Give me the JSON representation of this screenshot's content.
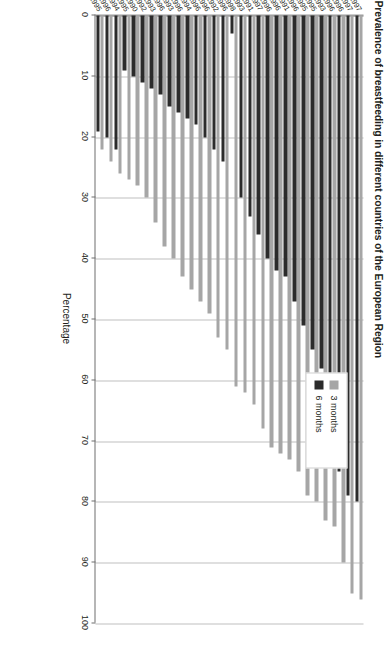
{
  "chart_data": {
    "type": "bar",
    "orientation": "horizontal",
    "title": "Prevalence of breastfeeding in different countries of the European Region",
    "xlabel": "",
    "ylabel": "Percentage",
    "ylim": [
      0,
      100
    ],
    "ytick_step": 10,
    "yticks": [
      "0",
      "10",
      "20",
      "30",
      "40",
      "50",
      "60",
      "70",
      "80",
      "90",
      "100"
    ],
    "grid": true,
    "legend_position": "upper-right",
    "legend": [
      "3 months",
      "6 months"
    ],
    "categories": [
      "Uzbekistan 1997",
      "Kyrgyzstan 1997",
      "Azerbaijan 1996",
      "Sweden 1996",
      "Bosnia and Herzegovina 1993",
      "Kazakhstan 1995",
      "Tajikistan 1995",
      "Federal Republic of Yugoslavia 1996",
      "Norway 1991",
      "Bulgaria 1989-1996",
      "Republic of Moldova 1996",
      "Poland 1997",
      "Czech Republic 1991",
      "Armenia 1993",
      "Georgia 1998",
      "Germany 1996",
      "Denmark 1992",
      "Estonia 1996",
      "Ukraine 1996",
      "Switzerland 1994",
      "Netherlands 1996",
      "Belarus 1993",
      "Russian Federation 1996",
      "Lithuania 1993",
      "Ireland 1992",
      "Slovakia 1990",
      "Croatia 1995",
      "Luxembourg 1994",
      "Latvia 1996",
      "United Kingdom 1995"
    ],
    "series": [
      {
        "name": "3 months",
        "color": "#a6a6a6",
        "values": [
          96,
          95,
          90,
          84,
          83,
          80,
          79,
          75,
          73,
          72,
          71,
          68,
          64,
          62,
          61,
          55,
          53,
          49,
          47,
          45,
          43,
          40,
          38,
          34,
          30,
          28,
          27,
          26,
          24,
          22
        ]
      },
      {
        "name": "6 months",
        "color": "#2b2b2b",
        "values": [
          80,
          79,
          75,
          63,
          58,
          55,
          51,
          47,
          43,
          42,
          40,
          36,
          33,
          30,
          3,
          24,
          22,
          20,
          18,
          17,
          16,
          15,
          13,
          12,
          11,
          10,
          9,
          22,
          20,
          19
        ]
      }
    ]
  },
  "legend": {
    "items": [
      {
        "label": "3 months",
        "color": "#a6a6a6"
      },
      {
        "label": "6 months",
        "color": "#2b2b2b"
      }
    ]
  },
  "axis": {
    "value_axis_title": "Percentage"
  }
}
